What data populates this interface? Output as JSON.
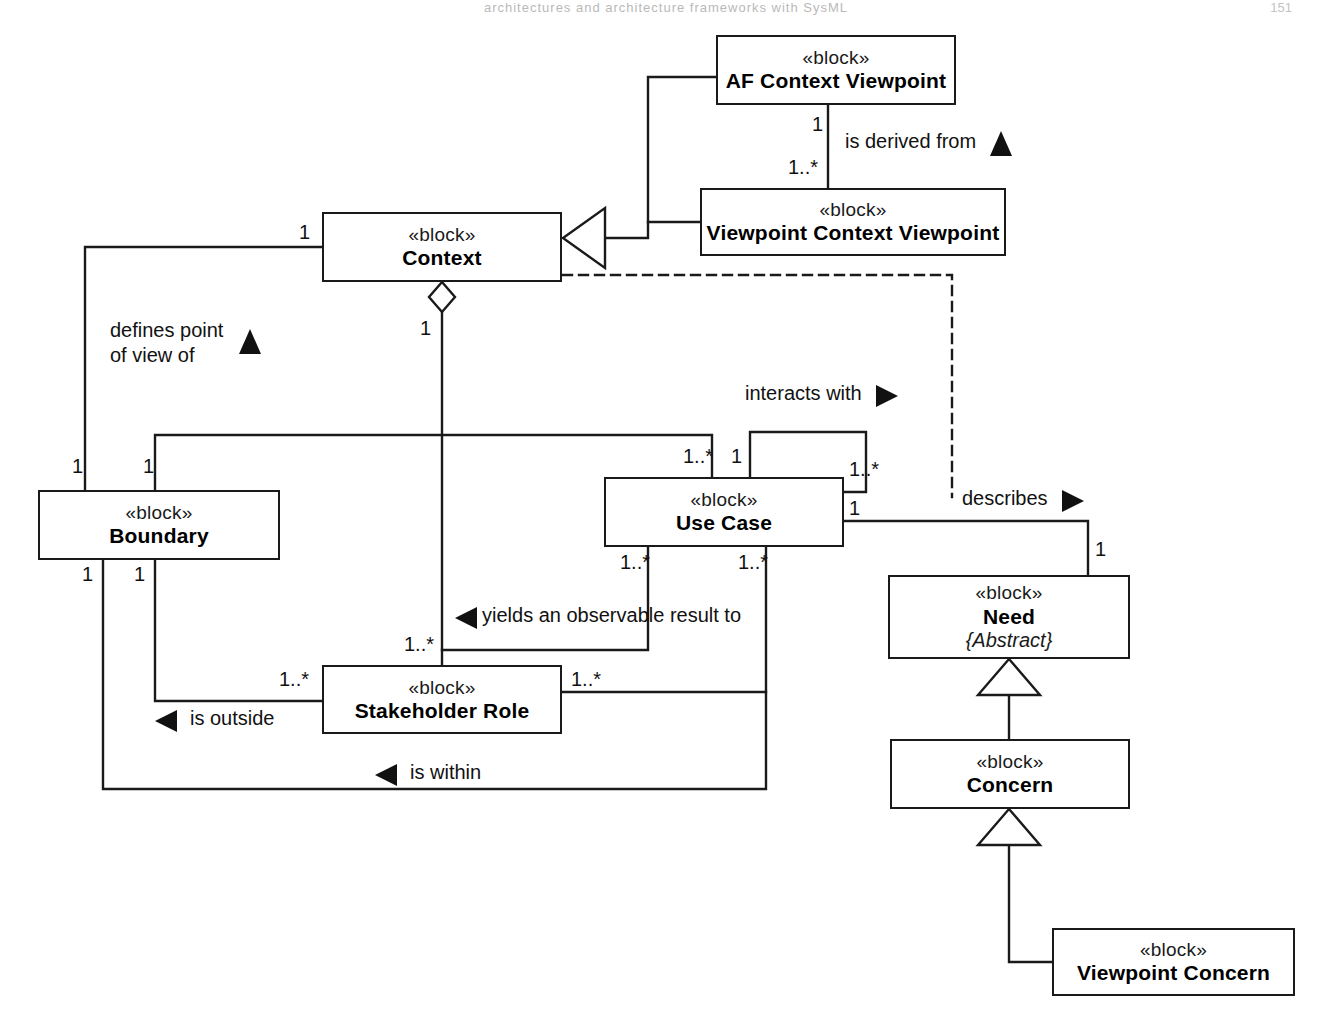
{
  "page": {
    "header": "architectures and architecture frameworks with SysML",
    "number": "151"
  },
  "diagram": {
    "type": "sysml-block-definition-diagram",
    "stereotype": "«block»",
    "blocks": [
      {
        "id": "af_context_viewpoint",
        "stereotype": "«block»",
        "name": "AF Context Viewpoint",
        "x": 716,
        "y": 35,
        "w": 240,
        "h": 70
      },
      {
        "id": "viewpoint_context_viewpoint",
        "stereotype": "«block»",
        "name": "Viewpoint Context Viewpoint",
        "x": 700,
        "y": 188,
        "w": 306,
        "h": 68
      },
      {
        "id": "context",
        "stereotype": "«block»",
        "name": "Context",
        "x": 322,
        "y": 212,
        "w": 240,
        "h": 70
      },
      {
        "id": "boundary",
        "stereotype": "«block»",
        "name": "Boundary",
        "x": 38,
        "y": 490,
        "w": 242,
        "h": 70
      },
      {
        "id": "use_case",
        "stereotype": "«block»",
        "name": "Use Case",
        "x": 604,
        "y": 477,
        "w": 240,
        "h": 70
      },
      {
        "id": "stakeholder_role",
        "stereotype": "«block»",
        "name": "Stakeholder Role",
        "x": 322,
        "y": 665,
        "w": 240,
        "h": 69
      },
      {
        "id": "need",
        "stereotype": "«block»",
        "name": "Need",
        "constraint": "{Abstract}",
        "x": 888,
        "y": 575,
        "w": 242,
        "h": 84
      },
      {
        "id": "concern",
        "stereotype": "«block»",
        "name": "Concern",
        "x": 890,
        "y": 739,
        "w": 240,
        "h": 70
      },
      {
        "id": "viewpoint_concern",
        "stereotype": "«block»",
        "name": "Viewpoint Concern",
        "x": 1052,
        "y": 928,
        "w": 243,
        "h": 68
      }
    ],
    "relationship_labels": [
      {
        "id": "is_derived_from",
        "text": "is derived from",
        "direction": "up",
        "x": 845,
        "y": 129
      },
      {
        "id": "defines_point_of_view_of",
        "text_line1": "defines point",
        "text_line2": "of view of",
        "direction": "up",
        "x": 110,
        "y": 318
      },
      {
        "id": "interacts_with",
        "text": "interacts with",
        "direction": "right",
        "x": 745,
        "y": 381
      },
      {
        "id": "describes",
        "text": "describes",
        "direction": "right",
        "x": 952,
        "y": 486
      },
      {
        "id": "yields_an_observable_result_to",
        "text": "yields an observable result to",
        "direction": "left",
        "x": 456,
        "y": 603
      },
      {
        "id": "is_outside",
        "text": "is outside",
        "direction": "left",
        "x": 155,
        "y": 675
      },
      {
        "id": "is_within",
        "text": "is within",
        "direction": "left",
        "x": 373,
        "y": 757
      }
    ],
    "multiplicities": [
      {
        "id": "m-af-ctx-vp-bottom",
        "text": "1",
        "x": 812,
        "y": 113
      },
      {
        "id": "m-vp-ctx-vp-top",
        "text": "1..*",
        "x": 793,
        "y": 156
      },
      {
        "id": "m-context-left",
        "text": "1",
        "x": 296,
        "y": 221
      },
      {
        "id": "m-context-bottom",
        "text": "1",
        "x": 418,
        "y": 317
      },
      {
        "id": "m-boundary-top-left",
        "text": "1",
        "x": 72,
        "y": 456
      },
      {
        "id": "m-boundary-top-right",
        "text": "1",
        "x": 143,
        "y": 456
      },
      {
        "id": "m-boundary-bottom-left",
        "text": "1",
        "x": 80,
        "y": 563
      },
      {
        "id": "m-boundary-bottom-right",
        "text": "1",
        "x": 133,
        "y": 563
      },
      {
        "id": "m-usecase-top-left",
        "text": "1..*",
        "x": 687,
        "y": 446
      },
      {
        "id": "m-usecase-top-right",
        "text": "1",
        "x": 738,
        "y": 446
      },
      {
        "id": "m-usecase-self-upper",
        "text": "1..*",
        "x": 849,
        "y": 459
      },
      {
        "id": "m-usecase-right",
        "text": "1",
        "x": 849,
        "y": 501
      },
      {
        "id": "m-usecase-bottom-left",
        "text": "1..*",
        "x": 627,
        "y": 551
      },
      {
        "id": "m-usecase-bottom-right",
        "text": "1..*",
        "x": 744,
        "y": 551
      },
      {
        "id": "m-need-top",
        "text": "1",
        "x": 1118,
        "y": 538
      },
      {
        "id": "m-stakeholder-top",
        "text": "1..*",
        "x": 409,
        "y": 633
      },
      {
        "id": "m-stakeholder-left",
        "text": "1..*",
        "x": 282,
        "y": 668
      },
      {
        "id": "m-stakeholder-right",
        "text": "1..*",
        "x": 571,
        "y": 668
      }
    ]
  }
}
